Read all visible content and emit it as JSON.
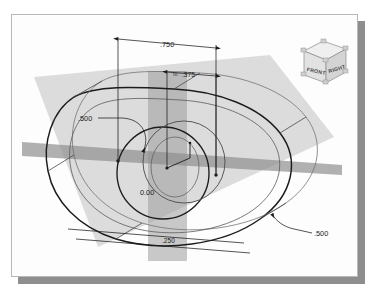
{
  "app": {
    "title": "3D CAD Sketch View",
    "canvas_background": "#fdfdfd",
    "shadow_color": "#8e8e8e",
    "border_color": "#b8b8b8"
  },
  "viewcube": {
    "name": "view-orientation-cube",
    "front_label": "FRONT",
    "right_label": "RIGHT",
    "face_color": "#e0e0e0",
    "top_color": "#f0f0f0",
    "edge_color": "#8a8a8a"
  },
  "geometry": {
    "description": "Obround slot extrusion with concentric circular features and two intersecting work planes",
    "plane_fill": "#c9c9c9",
    "plane_dark_fill": "#a8a8a8",
    "edge_color": "#1c1c1c",
    "hidden_edge_color": "#6e6e6e",
    "planes": [
      {
        "name": "vertical-work-plane",
        "orientation": "vertical"
      },
      {
        "name": "horizontal-work-plane",
        "orientation": "horizontal-edge-on"
      },
      {
        "name": "base-work-plane",
        "orientation": "angled-base"
      }
    ]
  },
  "dimensions": [
    {
      "id": "dim-width-top",
      "name": "dimension-750",
      "value": ".750",
      "prefix": "",
      "type": "linear",
      "position": "top"
    },
    {
      "id": "dim-offset",
      "name": "dimension-375",
      "value": ".375",
      "prefix": "fx:",
      "type": "linear-equation",
      "position": "top-inner"
    },
    {
      "id": "dim-radius-left",
      "name": "dimension-500-left",
      "value": ".500",
      "prefix": "",
      "type": "radial-leader",
      "position": "left"
    },
    {
      "id": "dim-origin",
      "name": "dimension-origin-000",
      "value": "0.00",
      "prefix": "",
      "type": "origin",
      "position": "center"
    },
    {
      "id": "dim-bottom",
      "name": "dimension-250",
      "value": ".250",
      "prefix": "",
      "type": "linear",
      "position": "bottom"
    },
    {
      "id": "dim-radius-right",
      "name": "dimension-500-right",
      "value": ".500",
      "prefix": "",
      "type": "radial-leader",
      "position": "right"
    }
  ]
}
